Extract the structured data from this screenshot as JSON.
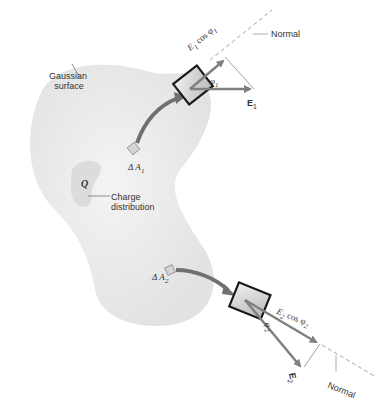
{
  "figure": {
    "labels": {
      "gaussian_surface_line1": "Gaussian",
      "gaussian_surface_line2": "surface",
      "normal_top": "Normal",
      "normal_bottom": "Normal",
      "charge_symbol": "Q",
      "charge_line1": "Charge",
      "charge_line2": "distribution",
      "delta_a1": "Δ A",
      "delta_a1_sub": "1",
      "delta_a2": "Δ A",
      "delta_a2_sub": "2",
      "e1_cos": "E",
      "e1_cos_sub": "1",
      "e1_cos_rest": " cos φ",
      "e1_cos_phi_sub": "1",
      "phi1": "φ",
      "phi1_sub": "1",
      "e1": "E",
      "e1_sub": "1",
      "e2_cos": "E",
      "e2_cos_sub": "2",
      "e2_cos_rest": " cos φ",
      "e2_cos_phi_sub": "2",
      "phi2": "φ",
      "phi2_sub": "2",
      "e2": "E",
      "e2_sub": "2"
    },
    "colors": {
      "surface_fill": "#ececec",
      "charge_fill": "#dcdcdc",
      "arrow": "#808080",
      "box_fill": "#d9d9d9",
      "box_border": "#1a1a1a",
      "dashed": "#999999"
    }
  }
}
